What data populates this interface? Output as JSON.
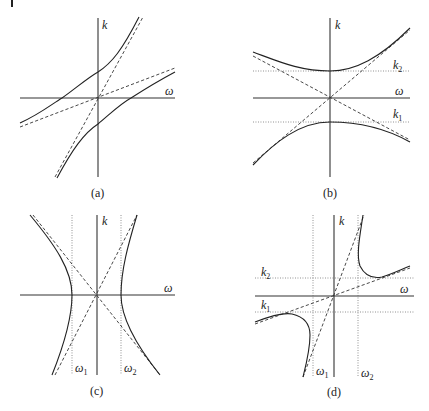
{
  "figure": {
    "page_marker": "|",
    "panels": [
      {
        "id": "a",
        "caption": "(a)",
        "axis_labels": {
          "vertical": "k",
          "horizontal": "ω"
        },
        "description": "Two hyperbola branches crossing the ω axis, each with two dashed asymptotes through the origin"
      },
      {
        "id": "b",
        "caption": "(b)",
        "axis_labels": {
          "vertical": "k",
          "horizontal": "ω"
        },
        "levels": [
          {
            "name": "k",
            "sub": "2"
          },
          {
            "name": "k",
            "sub": "1"
          }
        ],
        "description": "Upper branch with minimum at k2, lower branch with maximum at k1; dashed asymptotes cross at the origin"
      },
      {
        "id": "c",
        "caption": "(c)",
        "axis_labels": {
          "vertical": "k",
          "horizontal": "ω"
        },
        "levels": [
          {
            "name": "ω",
            "sub": "1"
          },
          {
            "name": "ω",
            "sub": "2"
          }
        ],
        "description": "Left/right hyperbola branches touching ω1 and ω2 at k=0; dashed asymptotes cross at the origin"
      },
      {
        "id": "d",
        "caption": "(d)",
        "axis_labels": {
          "vertical": "k",
          "horizontal": "ω"
        },
        "levels_k": [
          {
            "name": "k",
            "sub": "2"
          },
          {
            "name": "k",
            "sub": "1"
          }
        ],
        "levels_w": [
          {
            "name": "ω",
            "sub": "1"
          },
          {
            "name": "ω",
            "sub": "2"
          }
        ],
        "description": "Hyperbola branches in the first and third quadrants bounded by ω1, ω2, k1, k2 dotted lines with two dashed asymptotes through the origin"
      }
    ]
  }
}
